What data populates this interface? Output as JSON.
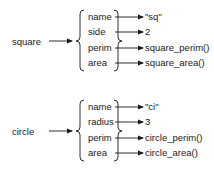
{
  "diagrams": [
    {
      "object": "square",
      "fields": [
        {
          "name": "name",
          "value": "\"sq\""
        },
        {
          "name": "side",
          "value": "2"
        },
        {
          "name": "perim",
          "value": "square_perim()"
        },
        {
          "name": "area",
          "value": "square_area()"
        }
      ]
    },
    {
      "object": "circle",
      "fields": [
        {
          "name": "name",
          "value": "\"ci\""
        },
        {
          "name": "radius",
          "value": "3"
        },
        {
          "name": "perim",
          "value": "circle_perim()"
        },
        {
          "name": "area",
          "value": "circle_area()"
        }
      ]
    }
  ],
  "colors": {
    "line": "#1a1a1a",
    "background": "#ffffff"
  }
}
